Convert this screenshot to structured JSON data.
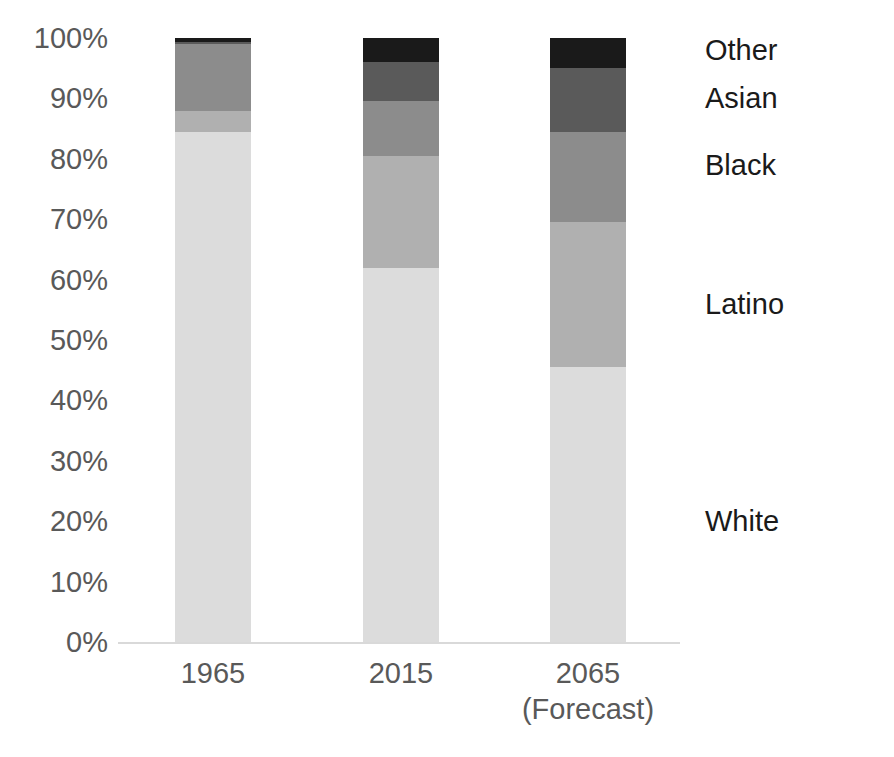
{
  "chart_data": {
    "type": "bar",
    "subtype": "stacked-100-percent",
    "title": "U.S. Population by Race/Ethnicity (1965–2065)",
    "title_visible": false,
    "xlabel": "",
    "ylabel": "",
    "ylim": [
      0,
      100
    ],
    "y_tick_labels": [
      "100%",
      "90%",
      "80%",
      "70%",
      "60%",
      "50%",
      "40%",
      "30%",
      "20%",
      "10%",
      "0%"
    ],
    "y_tick_values": [
      100,
      90,
      80,
      70,
      60,
      50,
      40,
      30,
      20,
      10,
      0
    ],
    "grid": false,
    "legend_position": "right-direct-labels",
    "categories": [
      "1965",
      "2015",
      "2065"
    ],
    "category_sublabels": [
      "",
      "",
      "(Forecast)"
    ],
    "series": [
      {
        "name": "White",
        "color": "#dcdcdc",
        "values": [
          84.5,
          62.0,
          45.5
        ]
      },
      {
        "name": "Latino",
        "color": "#b0b0b0",
        "values": [
          3.5,
          18.5,
          24.0
        ]
      },
      {
        "name": "Black",
        "color": "#8c8c8c",
        "values": [
          11.0,
          9.0,
          15.0
        ]
      },
      {
        "name": "Asian",
        "color": "#5a5a5a",
        "values": [
          0.3,
          6.5,
          10.5
        ]
      },
      {
        "name": "Other",
        "color": "#1a1a1a",
        "values": [
          0.7,
          4.0,
          5.0
        ]
      }
    ],
    "legend_labels": [
      {
        "label": "Other",
        "value_percent": 98
      },
      {
        "label": "Asian",
        "value_percent": 90
      },
      {
        "label": "Black",
        "value_percent": 79
      },
      {
        "label": "Latino",
        "value_percent": 56
      },
      {
        "label": "White",
        "value_percent": 20
      }
    ],
    "colors": {
      "white_segment": "#dcdcdc",
      "latino_segment": "#b0b0b0",
      "black_segment": "#8c8c8c",
      "asian_segment": "#5a5a5a",
      "other_segment": "#1a1a1a",
      "axis_text": "#595959",
      "legend_text": "#1a1a1a",
      "axis_line": "#d9d9d9",
      "background": "#ffffff"
    }
  }
}
